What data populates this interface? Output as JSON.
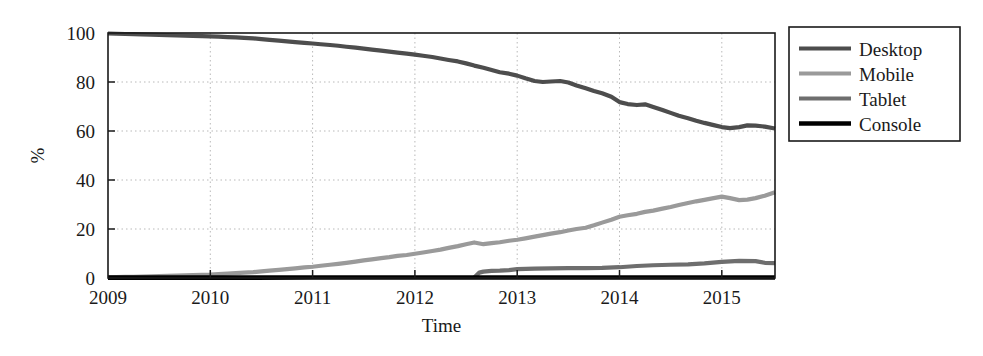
{
  "chart_data": {
    "type": "line",
    "title": "",
    "xlabel": "Time",
    "ylabel": "%",
    "xlim": [
      2009.0,
      2015.52
    ],
    "ylim": [
      0,
      100
    ],
    "grid": true,
    "legend_position": "right-outside",
    "xticks": [
      "2009",
      "2010",
      "2011",
      "2012",
      "2013",
      "2014",
      "2015"
    ],
    "xtick_values": [
      2009,
      2010,
      2011,
      2012,
      2013,
      2014,
      2015
    ],
    "yticks": [
      "0",
      "20",
      "40",
      "60",
      "80",
      "100"
    ],
    "ytick_values": [
      0,
      20,
      40,
      60,
      80,
      100
    ],
    "series": [
      {
        "name": "Desktop",
        "color": "#4d4d4d",
        "x": [
          2009.0,
          2009.08,
          2009.17,
          2009.25,
          2009.33,
          2009.42,
          2009.5,
          2009.58,
          2009.67,
          2009.75,
          2009.83,
          2009.92,
          2010.0,
          2010.08,
          2010.17,
          2010.25,
          2010.33,
          2010.42,
          2010.5,
          2010.58,
          2010.67,
          2010.75,
          2010.83,
          2010.92,
          2011.0,
          2011.08,
          2011.17,
          2011.25,
          2011.33,
          2011.42,
          2011.5,
          2011.58,
          2011.67,
          2011.75,
          2011.83,
          2011.92,
          2012.0,
          2012.08,
          2012.17,
          2012.25,
          2012.33,
          2012.42,
          2012.5,
          2012.58,
          2012.67,
          2012.75,
          2012.83,
          2012.92,
          2013.0,
          2013.08,
          2013.17,
          2013.25,
          2013.33,
          2013.42,
          2013.5,
          2013.58,
          2013.67,
          2013.75,
          2013.83,
          2013.92,
          2014.0,
          2014.08,
          2014.17,
          2014.25,
          2014.33,
          2014.42,
          2014.5,
          2014.58,
          2014.67,
          2014.75,
          2014.83,
          2014.92,
          2015.0,
          2015.08,
          2015.17,
          2015.25,
          2015.33,
          2015.42,
          2015.52
        ],
        "values": [
          99.8,
          99.7,
          99.6,
          99.5,
          99.4,
          99.3,
          99.2,
          99.1,
          99.0,
          98.9,
          98.8,
          98.7,
          98.6,
          98.5,
          98.3,
          98.2,
          98.0,
          97.8,
          97.5,
          97.2,
          96.9,
          96.6,
          96.3,
          96.0,
          95.7,
          95.4,
          95.1,
          94.8,
          94.4,
          94.0,
          93.6,
          93.2,
          92.8,
          92.4,
          92.0,
          91.6,
          91.2,
          90.7,
          90.2,
          89.6,
          89.0,
          88.4,
          87.6,
          86.7,
          85.8,
          84.9,
          84.0,
          83.4,
          82.6,
          81.5,
          80.4,
          80.0,
          80.2,
          80.4,
          79.8,
          78.6,
          77.4,
          76.3,
          75.4,
          74.0,
          71.8,
          71.0,
          70.6,
          70.9,
          69.8,
          68.6,
          67.4,
          66.2,
          65.2,
          64.2,
          63.3,
          62.4,
          61.6,
          61.2,
          61.6,
          62.3,
          62.2,
          61.8,
          61.0
        ]
      },
      {
        "name": "Mobile",
        "color": "#9a9a9a",
        "x": [
          2009.0,
          2009.08,
          2009.17,
          2009.25,
          2009.33,
          2009.42,
          2009.5,
          2009.58,
          2009.67,
          2009.75,
          2009.83,
          2009.92,
          2010.0,
          2010.08,
          2010.17,
          2010.25,
          2010.33,
          2010.42,
          2010.5,
          2010.58,
          2010.67,
          2010.75,
          2010.83,
          2010.92,
          2011.0,
          2011.08,
          2011.17,
          2011.25,
          2011.33,
          2011.42,
          2011.5,
          2011.58,
          2011.67,
          2011.75,
          2011.83,
          2011.92,
          2012.0,
          2012.08,
          2012.17,
          2012.25,
          2012.33,
          2012.42,
          2012.5,
          2012.58,
          2012.67,
          2012.75,
          2012.83,
          2012.92,
          2013.0,
          2013.08,
          2013.17,
          2013.25,
          2013.33,
          2013.42,
          2013.5,
          2013.58,
          2013.67,
          2013.75,
          2013.83,
          2013.92,
          2014.0,
          2014.08,
          2014.17,
          2014.25,
          2014.33,
          2014.42,
          2014.5,
          2014.58,
          2014.67,
          2014.75,
          2014.83,
          2014.92,
          2015.0,
          2015.08,
          2015.17,
          2015.25,
          2015.33,
          2015.42,
          2015.52
        ],
        "values": [
          0.3,
          0.4,
          0.5,
          0.5,
          0.6,
          0.7,
          0.8,
          0.9,
          1.0,
          1.1,
          1.2,
          1.3,
          1.4,
          1.6,
          1.8,
          2.0,
          2.2,
          2.4,
          2.7,
          3.0,
          3.3,
          3.6,
          3.9,
          4.3,
          4.6,
          5.0,
          5.4,
          5.8,
          6.2,
          6.7,
          7.2,
          7.6,
          8.1,
          8.5,
          9.0,
          9.4,
          9.9,
          10.4,
          11.0,
          11.6,
          12.3,
          13.0,
          13.8,
          14.5,
          13.8,
          14.2,
          14.6,
          15.2,
          15.6,
          16.2,
          16.9,
          17.5,
          18.1,
          18.7,
          19.4,
          20.0,
          20.5,
          21.5,
          22.6,
          23.8,
          25.0,
          25.6,
          26.2,
          27.0,
          27.5,
          28.3,
          29.0,
          29.8,
          30.6,
          31.3,
          31.9,
          32.6,
          33.2,
          32.6,
          31.8,
          32.0,
          32.6,
          33.6,
          35.0
        ]
      },
      {
        "name": "Tablet",
        "color": "#6e6e6e",
        "x": [
          2012.58,
          2012.63,
          2012.67,
          2012.75,
          2012.83,
          2012.92,
          2013.0,
          2013.17,
          2013.33,
          2013.5,
          2013.67,
          2013.83,
          2014.0,
          2014.17,
          2014.33,
          2014.5,
          2014.67,
          2014.83,
          2015.0,
          2015.17,
          2015.33,
          2015.42,
          2015.52
        ],
        "values": [
          0.2,
          2.2,
          2.6,
          2.9,
          3.0,
          3.2,
          3.6,
          3.8,
          3.9,
          4.0,
          4.0,
          4.1,
          4.4,
          4.9,
          5.2,
          5.4,
          5.6,
          6.0,
          6.6,
          7.0,
          6.9,
          6.2,
          6.1
        ]
      },
      {
        "name": "Console",
        "color": "#000000",
        "x": [
          2009.0,
          2010.0,
          2011.0,
          2012.0,
          2013.0,
          2014.0,
          2015.0,
          2015.52
        ],
        "values": [
          0.15,
          0.15,
          0.2,
          0.2,
          0.2,
          0.2,
          0.2,
          0.2
        ]
      }
    ]
  },
  "legend": {
    "items": [
      {
        "label": "Desktop"
      },
      {
        "label": "Mobile"
      },
      {
        "label": "Tablet"
      },
      {
        "label": "Console"
      }
    ]
  },
  "axes": {
    "y_title": "%",
    "x_title": "Time"
  }
}
